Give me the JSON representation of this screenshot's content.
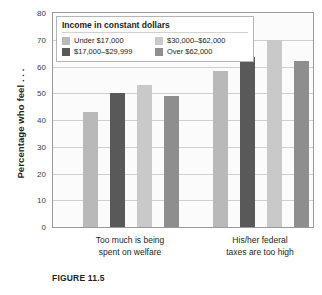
{
  "figure": {
    "caption": "FIGURE 11.5"
  },
  "chart_data": {
    "type": "bar",
    "title": "",
    "xlabel": "",
    "ylabel": "Percentage who feel . . .",
    "ylim": [
      0,
      80
    ],
    "ytick_step": 10,
    "yticks": [
      "80",
      "70",
      "60",
      "50",
      "40",
      "30",
      "20",
      "10",
      "0"
    ],
    "grid": true,
    "legend_position": "inside-top-left",
    "legend_title": "Income in constant dollars",
    "categories": [
      "Too much is being spent on welfare",
      "His/her federal taxes are too high"
    ],
    "category_lines": [
      [
        "Too much is being",
        "spent on welfare"
      ],
      [
        "His/her federal",
        "taxes are too high"
      ]
    ],
    "series": [
      {
        "name": "Under $17,000",
        "color": "#b9b9b9",
        "values": [
          43,
          58.5
        ]
      },
      {
        "name": "$17,000–$29,999",
        "color": "#595959",
        "values": [
          50,
          63.5
        ]
      },
      {
        "name": "$30,000–$62,000",
        "color": "#c9c9c9",
        "values": [
          53,
          70
        ]
      },
      {
        "name": "Over $62,000",
        "color": "#8e8e8e",
        "values": [
          49,
          62
        ]
      }
    ]
  },
  "colors": {
    "plot_background": "#fbfbfb",
    "plot_border": "#9a9a9a",
    "gridline": "#cfcfcf",
    "text": "#231f20",
    "legend_border": "#b5b5b5"
  }
}
